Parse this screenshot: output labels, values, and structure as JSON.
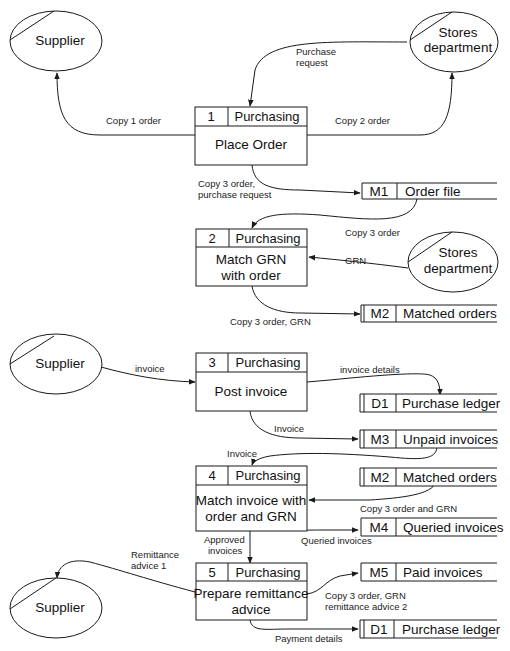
{
  "diagram": {
    "type": "data-flow-diagram",
    "entities": [
      {
        "id": "supplier-1",
        "label": "Supplier"
      },
      {
        "id": "stores-1",
        "label_lines": [
          "Stores",
          "department"
        ]
      },
      {
        "id": "stores-2",
        "label_lines": [
          "Stores",
          "department"
        ]
      },
      {
        "id": "supplier-2",
        "label": "Supplier"
      },
      {
        "id": "supplier-3",
        "label": "Supplier"
      }
    ],
    "processes": [
      {
        "number": "1",
        "owner": "Purchasing",
        "name_lines": [
          "Place Order"
        ]
      },
      {
        "number": "2",
        "owner": "Purchasing",
        "name_lines": [
          "Match GRN",
          "with order"
        ]
      },
      {
        "number": "3",
        "owner": "Purchasing",
        "name_lines": [
          "Post invoice"
        ]
      },
      {
        "number": "4",
        "owner": "Purchasing",
        "name_lines": [
          "Match invoice with",
          "order and GRN"
        ]
      },
      {
        "number": "5",
        "owner": "Purchasing",
        "name_lines": [
          "Prepare remittance",
          "advice"
        ]
      }
    ],
    "stores": [
      {
        "id": "M1",
        "label": "Order file"
      },
      {
        "id": "M2",
        "label": "Matched orders"
      },
      {
        "id": "D1",
        "label": "Purchase ledger"
      },
      {
        "id": "M3",
        "label": "Unpaid invoices"
      },
      {
        "id": "M2",
        "label": "Matched orders"
      },
      {
        "id": "M4",
        "label": "Queried invoices"
      },
      {
        "id": "M5",
        "label": "Paid invoices"
      },
      {
        "id": "D1",
        "label": "Purchase ledger"
      }
    ],
    "flows": [
      {
        "label_lines": [
          "Purchase",
          "request"
        ],
        "from": "Stores department",
        "to": "1"
      },
      {
        "label_lines": [
          "Copy 1 order"
        ],
        "from": "1",
        "to": "Supplier"
      },
      {
        "label_lines": [
          "Copy 2 order"
        ],
        "from": "1",
        "to": "Stores department"
      },
      {
        "label_lines": [
          "Copy 3 order,",
          "purchase request"
        ],
        "from": "1",
        "to": "M1"
      },
      {
        "label_lines": [
          "Copy 3 order"
        ],
        "from": "M1",
        "to": "2"
      },
      {
        "label_lines": [
          "GRN"
        ],
        "from": "Stores department",
        "to": "2"
      },
      {
        "label_lines": [
          "Copy 3 order, GRN"
        ],
        "from": "2",
        "to": "M2"
      },
      {
        "label_lines": [
          "invoice"
        ],
        "from": "Supplier",
        "to": "3"
      },
      {
        "label_lines": [
          "invoice details"
        ],
        "from": "3",
        "to": "D1"
      },
      {
        "label_lines": [
          "Invoice"
        ],
        "from": "3",
        "to": "M3"
      },
      {
        "label_lines": [
          "Invoice"
        ],
        "from": "M3",
        "to": "4"
      },
      {
        "label_lines": [
          "Copy 3 order and GRN"
        ],
        "from": "M2",
        "to": "4"
      },
      {
        "label_lines": [
          "Queried invoices"
        ],
        "from": "4",
        "to": "M4"
      },
      {
        "label_lines": [
          "Approved",
          "invoices"
        ],
        "from": "4",
        "to": "5"
      },
      {
        "label_lines": [
          "Remittance",
          "advice 1"
        ],
        "from": "5",
        "to": "Supplier"
      },
      {
        "label_lines": [
          "Copy 3 order, GRN",
          "remittance advice 2"
        ],
        "from": "5",
        "to": "M5"
      },
      {
        "label_lines": [
          "Payment details"
        ],
        "from": "5",
        "to": "D1"
      }
    ]
  }
}
